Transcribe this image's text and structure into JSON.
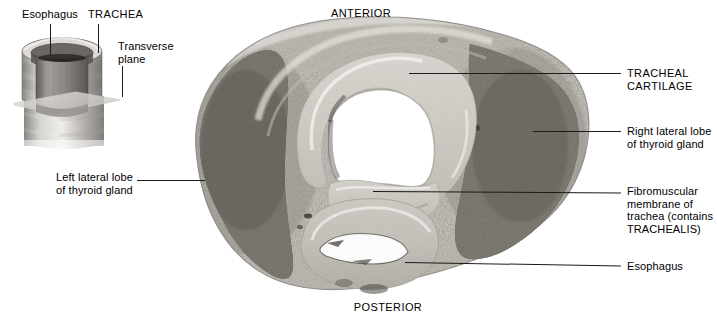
{
  "figure": {
    "type": "anatomical-cross-section-photograph"
  },
  "inset": {
    "name": "trachea-3d-orientation-inset",
    "description": "Cutaway three-dimensional drawing of the trachea with the esophagus behind it, intersected by a transparent transverse plane",
    "labels": [
      {
        "id": "esophagus",
        "text": "Esophagus",
        "style": "sentence"
      },
      {
        "id": "trachea",
        "text": "TRACHEA",
        "style": "caps"
      },
      {
        "id": "transverse_plane",
        "text": "Transverse\nplane",
        "style": "sentence"
      }
    ]
  },
  "orientation": {
    "top": "ANTERIOR",
    "bottom": "POSTERIOR"
  },
  "callouts": {
    "left": [
      {
        "id": "left-lateral-lobe",
        "text": "Left lateral lobe\nof thyroid gland"
      }
    ],
    "right": [
      {
        "id": "tracheal-cartilage",
        "text": "TRACHEAL\nCARTILAGE",
        "style": "caps"
      },
      {
        "id": "right-lateral-lobe",
        "text": "Right lateral lobe\nof thyroid gland",
        "style": "sentence"
      },
      {
        "id": "fibromuscular-membrane",
        "text": "Fibromuscular\nmembrane of\ntrachea (contains\nTRACHEALIS)",
        "style": "sentence"
      },
      {
        "id": "esophagus",
        "text": "Esophagus",
        "style": "sentence"
      }
    ]
  },
  "colors": {
    "background": "#ffffff",
    "text": "#000000",
    "leader_line": "#1a1a1a",
    "specimen_light": "#e9e7e2",
    "specimen_mid": "#b9b5ae",
    "specimen_dark": "#6e6a64",
    "thyroid_tissue": "#7d7974",
    "cartilage": "#dcd9d3",
    "lumen": "#ffffff",
    "inset_metal_light": "#d9d7d2",
    "inset_metal_mid": "#a9a6a1",
    "inset_metal_dark": "#6d6a66",
    "plane_fill": "#cfcdc8"
  }
}
